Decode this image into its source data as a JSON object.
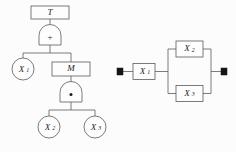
{
  "figure": {
    "name": "fault-tree-and-reliability-block-diagram",
    "background_color": "#fcfcfc",
    "line_color": "#5b5b5b",
    "text_color": "#1d1d1d",
    "terminal_color": "#151515"
  },
  "fault_tree": {
    "top_event": {
      "label": "T",
      "shape": "rectangle"
    },
    "gates": [
      {
        "id": "or-gate",
        "glyph": "+",
        "type": "OR",
        "shape": "arched"
      },
      {
        "id": "and-gate",
        "glyph": "·",
        "type": "AND",
        "shape": "arched"
      }
    ],
    "intermediate_event": {
      "label": "M",
      "shape": "rectangle"
    },
    "basic_events": [
      {
        "id": "x1",
        "base": "X",
        "subscript": "1",
        "shape": "circle"
      },
      {
        "id": "x2",
        "base": "X",
        "subscript": "2",
        "shape": "circle"
      },
      {
        "id": "x3",
        "base": "X",
        "subscript": "3",
        "shape": "circle"
      }
    ]
  },
  "block_diagram": {
    "terminals": [
      {
        "id": "terminal-left",
        "shape": "filled-square"
      },
      {
        "id": "terminal-right",
        "shape": "filled-square"
      }
    ],
    "blocks": [
      {
        "id": "block-x1",
        "base": "X",
        "subscript": "1",
        "arrangement": "series"
      },
      {
        "id": "block-x2",
        "base": "X",
        "subscript": "2",
        "arrangement": "parallel"
      },
      {
        "id": "block-x3",
        "base": "X",
        "subscript": "3",
        "arrangement": "parallel"
      }
    ]
  }
}
